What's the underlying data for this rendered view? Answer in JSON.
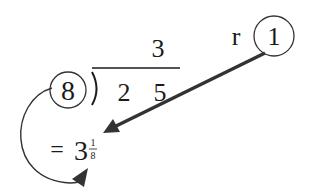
{
  "diagram": {
    "divisor": "8",
    "dividend_digits": [
      "2",
      "5"
    ],
    "quotient": "3",
    "remainder_label": "r",
    "remainder": "1",
    "result": {
      "equals": "=",
      "whole": "3",
      "numerator": "1",
      "denominator": "8"
    },
    "colors": {
      "ink": "#1a1a1a",
      "arrow": "#333333",
      "background": "#ffffff"
    }
  }
}
